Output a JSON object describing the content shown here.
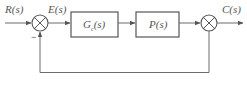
{
  "diagram": {
    "type": "feedback-control-block-diagram",
    "signals": {
      "input": "R(s)",
      "error": "E(s)",
      "output": "C(s)"
    },
    "blocks": [
      {
        "id": "controller",
        "name": "G",
        "subscript": "c",
        "arg": "(s)"
      },
      {
        "id": "plant",
        "label": "P(s)"
      }
    ],
    "summing_junctions": [
      {
        "id": "sum1",
        "signs": {
          "feedback": "−"
        }
      },
      {
        "id": "sum2",
        "signs": {}
      }
    ],
    "colors": {
      "line": "#6b6b6b",
      "text": "#555555",
      "background": "#ffffff"
    }
  }
}
